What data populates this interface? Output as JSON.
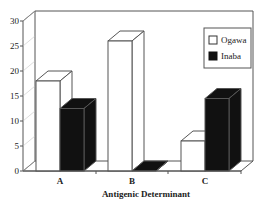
{
  "chart_data": {
    "type": "bar",
    "style": "3d-clustered",
    "title": "",
    "xlabel": "Antigenic Determinant",
    "ylabel": "",
    "categories": [
      "A",
      "B",
      "C"
    ],
    "series": [
      {
        "name": "Ogawa",
        "color": "#ffffff",
        "values": [
          18,
          26,
          6
        ]
      },
      {
        "name": "Inaba",
        "color": "#111111",
        "values": [
          12.5,
          0,
          14.5
        ]
      }
    ],
    "ylim": [
      0,
      30
    ],
    "yticks": [
      0,
      5,
      10,
      15,
      20,
      25,
      30
    ],
    "grid": false,
    "legend_position": "upper-right-inside"
  },
  "legend": {
    "items": [
      {
        "label": "Ogawa",
        "color": "#ffffff"
      },
      {
        "label": "Inaba",
        "color": "#111111"
      }
    ]
  }
}
